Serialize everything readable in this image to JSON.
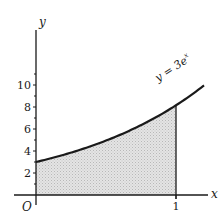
{
  "chart_data": {
    "type": "area",
    "title": "",
    "xlabel": "x",
    "ylabel": "y",
    "function": "y = 3e^x",
    "curve_label": "y = 3e",
    "curve_label_exponent": "x",
    "origin_label": "O",
    "x_ticks": [
      {
        "value": 1,
        "label": "1"
      }
    ],
    "y_ticks": [
      {
        "value": 2,
        "label": "2"
      },
      {
        "value": 4,
        "label": "4"
      },
      {
        "value": 6,
        "label": "6"
      },
      {
        "value": 8,
        "label": "8"
      },
      {
        "value": 10,
        "label": "10"
      }
    ],
    "y_minor_ticks": [
      1,
      3,
      5,
      7,
      9,
      11
    ],
    "xlim": [
      0,
      1.3
    ],
    "ylim": [
      0,
      11.5
    ],
    "shaded_region": {
      "from_x": 0,
      "to_x": 1,
      "description": "area under y = 3e^x from x=0 to x=1"
    },
    "points": [
      {
        "x": 0,
        "y": 3.0
      },
      {
        "x": 0.25,
        "y": 3.85
      },
      {
        "x": 0.5,
        "y": 4.95
      },
      {
        "x": 0.75,
        "y": 6.35
      },
      {
        "x": 1.0,
        "y": 8.15
      },
      {
        "x": 1.17,
        "y": 9.65
      }
    ],
    "grid": false,
    "legend": "none"
  },
  "colors": {
    "ink": "#1a1a1a",
    "shade": "#d4d4d4",
    "background": "#ffffff"
  }
}
